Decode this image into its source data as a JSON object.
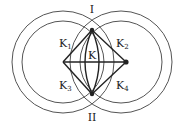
{
  "diagram": {
    "labels": {
      "top": "I",
      "bottom": "II",
      "center": "K",
      "k1": {
        "base": "K",
        "sub": "1"
      },
      "k2": {
        "base": "K",
        "sub": "2"
      },
      "k3": {
        "base": "K",
        "sub": "3"
      },
      "k4": {
        "base": "K",
        "sub": "4"
      }
    },
    "colors": {
      "circle": "#555555",
      "line": "#222222",
      "background": "#ffffff"
    }
  }
}
